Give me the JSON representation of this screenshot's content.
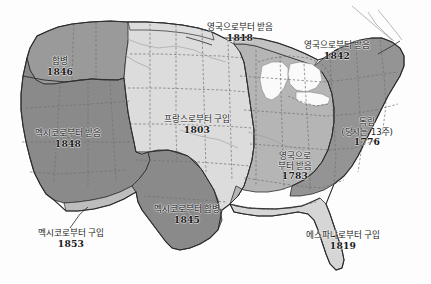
{
  "map": {
    "title": "미국 영토 확장 지도",
    "regions": [
      {
        "id": "oregon-annexation",
        "name": "합병 1846",
        "label": "합병",
        "year": "1846",
        "fill": "#9a9a9a"
      },
      {
        "id": "mexican-cession",
        "name": "멕시코로부터 받음 1848",
        "label": "멕시코로부터 받음",
        "year": "1848",
        "fill": "#8a8a8a"
      },
      {
        "id": "gadsden-purchase",
        "name": "멕시코로부터 구입 1853",
        "label": "멕시코로부터 구입",
        "year": "1853",
        "fill": "#bdbdbd"
      },
      {
        "id": "texas-annexation",
        "name": "멕시코로부터 합병 1845",
        "label": "멕시코로부터 합병",
        "year": "1845",
        "fill": "#8a8a8a"
      },
      {
        "id": "louisiana-purchase",
        "name": "프랑스로부터 구입 1803",
        "label": "프랑스로부터 구입",
        "year": "1803",
        "fill": "#dcdcdc"
      },
      {
        "id": "red-river-1818",
        "name": "영국으로부터 받음 1818",
        "label": "영국으로부터 받음",
        "year": "1818",
        "fill": "#dcdcdc"
      },
      {
        "id": "webster-ashburton-1842",
        "name": "영국으로부터 받음 1842",
        "label": "영국으로부터 받음",
        "year": "1842",
        "fill": "#c2c2c2"
      },
      {
        "id": "treaty-of-paris-1783",
        "name": "영국으로부터 받음 1783",
        "label_line1": "영국으로",
        "label_line2": "부터 받음",
        "year": "1783",
        "fill": "#b5b5b5"
      },
      {
        "id": "original-thirteen-1776",
        "name": "독립 (당시는 13주) 1776",
        "label_line1": "독립",
        "label_line2": "(당시는 13주)",
        "year": "1776",
        "fill": "#949494"
      },
      {
        "id": "florida-purchase-1819",
        "name": "에스파냐로부터 구입 1819",
        "label": "에스파냐로부터 구입",
        "year": "1819",
        "fill": "#d6d6d6"
      }
    ],
    "colors": {
      "outline": "#2b2b2b",
      "state_border": "#6d6d6d",
      "lake": "#f4f4f4",
      "background": "#fdfdfd"
    }
  }
}
